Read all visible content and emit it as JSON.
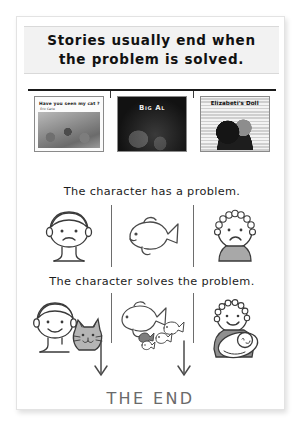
{
  "slide": {
    "title_line_1": "Stories usually end when",
    "title_line_2": "the problem is solved.",
    "the_end_label": "THE END"
  },
  "books": [
    {
      "name": "have-you-seen-my-cat",
      "title": "Have you seen my cat ?",
      "author": "Eric Carle",
      "cover_type": "collage-photo"
    },
    {
      "name": "big-al",
      "title": "Big Al",
      "author": "",
      "cover_type": "dark-ocean"
    },
    {
      "name": "elizabetis-doll",
      "title": "Elizabeti's Doll",
      "author": "",
      "cover_type": "patterned-cloth"
    }
  ],
  "rows": [
    {
      "name": "problem-row",
      "sentence": "The character has a problem.",
      "panels": [
        {
          "name": "sad-boy-panel",
          "icon": "sad-boy-icon",
          "caption": ""
        },
        {
          "name": "lonely-fish-panel",
          "icon": "fish-icon",
          "caption": ""
        },
        {
          "name": "sad-girl-panel",
          "icon": "sad-girl-icon",
          "caption": ""
        }
      ]
    },
    {
      "name": "solution-row",
      "sentence": "The character solves the problem.",
      "panels": [
        {
          "name": "happy-boy-with-cat-panel",
          "icon": "boy-with-cat-icon",
          "caption": ""
        },
        {
          "name": "fish-with-friends-panel",
          "icon": "fish-school-icon",
          "caption": ""
        },
        {
          "name": "girl-with-doll-panel",
          "icon": "girl-with-doll-icon",
          "caption": ""
        }
      ]
    }
  ],
  "arrows": [
    {
      "name": "arrow-down-left",
      "direction": "down"
    },
    {
      "name": "arrow-down-right",
      "direction": "down"
    }
  ],
  "colors": {
    "title_band_bg": "#f2f2f2",
    "rule": "#1a1a1a",
    "ink": "#1c1c1c",
    "the_end": "#6a6a6a",
    "divider": "#6d6d6d",
    "card_bg": "#ffffff"
  }
}
